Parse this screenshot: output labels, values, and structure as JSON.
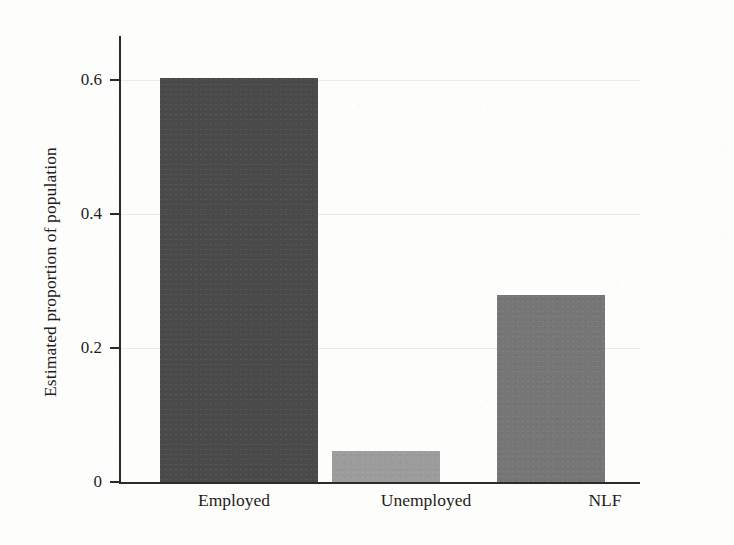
{
  "figure": {
    "background_color": "#fdfdfb",
    "axis_color": "#2b2b2b"
  },
  "chart_data": {
    "type": "bar",
    "title": "",
    "subtitle": "",
    "xlabel": "",
    "ylabel": "Estimated proportion of population",
    "categories": [
      "Employed",
      "Unemployed",
      "NLF"
    ],
    "values": [
      0.65,
      0.05,
      0.3
    ],
    "bar_colors": [
      "#4a4a4a",
      "#9c9c9c",
      "#767676"
    ],
    "ylim": [
      0,
      0.72
    ],
    "yticks": [
      0,
      0.2,
      0.4,
      0.6
    ],
    "ytick_labels": [
      "0",
      "0.2",
      "0.4",
      "0.6"
    ],
    "xticks": [
      "Employed",
      "Unemployed",
      "NLF"
    ],
    "grid": false,
    "legend": null,
    "annotations": []
  }
}
